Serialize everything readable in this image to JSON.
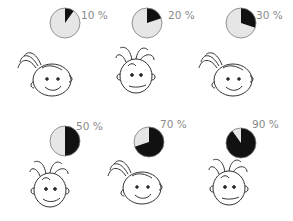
{
  "chart_data": {
    "type": "pie",
    "title": "",
    "colors": {
      "filled": "#111111",
      "empty": "#e6e6e6",
      "outline": "#7a7a7a",
      "label": "#8a8a8a"
    },
    "items": [
      {
        "label": "10 %",
        "value": 10
      },
      {
        "label": "20 %",
        "value": 20
      },
      {
        "label": "30 %",
        "value": 30
      },
      {
        "label": "50 %",
        "value": 50
      },
      {
        "label": "70 %",
        "value": 70
      },
      {
        "label": "90 %",
        "value": 90
      }
    ]
  },
  "panels": [
    {
      "label": "10 %",
      "value": 10,
      "face": "girl-smiling"
    },
    {
      "label": "20 %",
      "value": 20,
      "face": "boy-neutral"
    },
    {
      "label": "30 %",
      "value": 30,
      "face": "girl-smiling"
    },
    {
      "label": "50 %",
      "value": 50,
      "face": "boy-smiling"
    },
    {
      "label": "70 %",
      "value": 70,
      "face": "girl-smiling"
    },
    {
      "label": "90 %",
      "value": 90,
      "face": "boy-neutral"
    }
  ]
}
